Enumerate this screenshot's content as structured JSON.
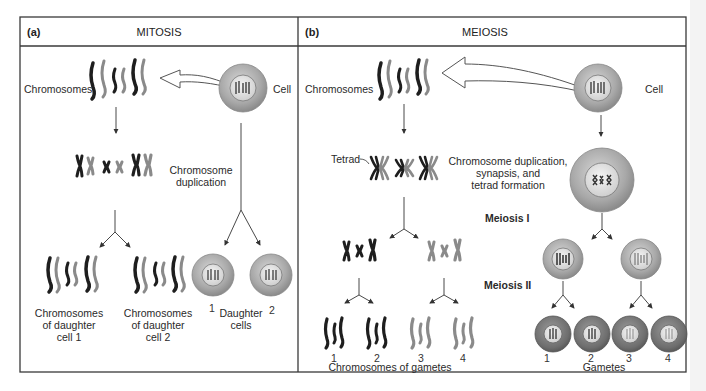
{
  "panels": {
    "mitosis": {
      "letter": "(a)",
      "title": "MITOSIS",
      "chromosomes_label": "Chromosomes",
      "cell_label": "Cell",
      "duplication_label_line1": "Chromosome",
      "duplication_label_line2": "duplication",
      "daughter1_line1": "Chromosomes",
      "daughter1_line2": "of daughter",
      "daughter1_line3": "cell 1",
      "daughter2_line1": "Chromosomes",
      "daughter2_line2": "of daughter",
      "daughter2_line3": "cell 2",
      "daughter_cells_line1": "Daughter",
      "daughter_cells_line2": "cells",
      "cell_numbers": [
        "1",
        "2"
      ]
    },
    "meiosis": {
      "letter": "(b)",
      "title": "MEIOSIS",
      "chromosomes_label": "Chromosomes",
      "cell_label": "Cell",
      "tetrad_label": "Tetrad",
      "duplication_line1": "Chromosome duplication,",
      "duplication_line2": "synapsis, and",
      "duplication_line3": "tetrad formation",
      "meiosis1_label": "Meiosis I",
      "meiosis2_label": "Meiosis II",
      "gamete_chromosome_numbers": [
        "1",
        "2",
        "3",
        "4"
      ],
      "gamete_chromosomes_label": "Chromosomes of gametes",
      "gamete_numbers": [
        "1",
        "2",
        "3",
        "4"
      ],
      "gametes_label": "Gametes"
    }
  },
  "colors": {
    "border": "#3a3a3a",
    "dark_chromosome": "#1e1e1e",
    "light_chromosome": "#8a8a8a",
    "cell_outer": "#9a9a9a",
    "cell_inner": "#e2e2e2",
    "arrow": "#333333"
  }
}
